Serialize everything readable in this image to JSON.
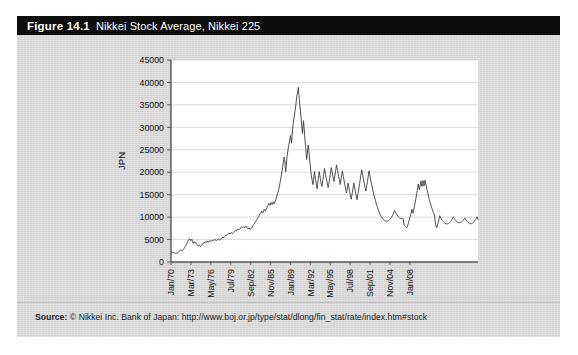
{
  "figure": {
    "number_label": "Figure 14.1",
    "title": "Nikkei Stock Average, Nikkei 225",
    "source_label": "Source:",
    "source_text": "© Nikkei Inc. Bank of Japan: http://www.boj.or.jp/type/stat/dlong/fin_stat/rate/index.htm#stock",
    "colors": {
      "title_bar_background": "#0d0d0d",
      "title_text": "#ffffff",
      "panel_background": "#d9d9d9",
      "plot_background": "#ffffff",
      "series_line": "#3a3a3a",
      "gridline": "#cfcfcf",
      "axis_line": "#555555"
    }
  },
  "chart_data": {
    "type": "line",
    "title": "Nikkei Stock Average, Nikkei 225",
    "xlabel": "",
    "ylabel": "JPN",
    "ylim": [
      0,
      45000
    ],
    "ytick_values": [
      0,
      5000,
      10000,
      15000,
      20000,
      25000,
      30000,
      35000,
      40000,
      45000
    ],
    "ytick_labels": [
      "0",
      "5000",
      "10000",
      "15000",
      "20000",
      "25000",
      "30000",
      "35000",
      "40000",
      "45000"
    ],
    "xtick_labels": [
      "Jan/70",
      "Mar/73",
      "May/76",
      "Jul/79",
      "Sep/82",
      "Nov/85",
      "Jan/89",
      "Mar/92",
      "May/95",
      "Jul/98",
      "Sep/01",
      "Nov/04",
      "Jan/08"
    ],
    "xtick_indices": [
      0,
      38,
      76,
      114,
      152,
      190,
      228,
      266,
      304,
      342,
      380,
      418,
      456
    ],
    "grid": "horizontal",
    "legend": "none",
    "x_start": "Jan/70",
    "x_end": "Jul/10",
    "x_step": "monthly",
    "n_points": 487,
    "series": [
      {
        "name": "Nikkei 225",
        "units": "JPN",
        "values": [
          2380,
          2310,
          2180,
          2120,
          2060,
          2100,
          2010,
          1960,
          1930,
          1990,
          1950,
          1990,
          2000,
          2070,
          2140,
          2290,
          2490,
          2570,
          2680,
          2560,
          2620,
          2700,
          2570,
          2710,
          2820,
          3010,
          3280,
          3480,
          3650,
          3800,
          4030,
          4280,
          4550,
          4860,
          5010,
          5210,
          5100,
          4820,
          4720,
          5130,
          4980,
          4620,
          4350,
          4190,
          4560,
          4400,
          4200,
          4310,
          4150,
          3990,
          3820,
          3720,
          3560,
          3730,
          3830,
          3660,
          3470,
          3460,
          3580,
          3820,
          3930,
          4080,
          4260,
          4410,
          4390,
          4280,
          4490,
          4580,
          4430,
          4520,
          4730,
          4360,
          4480,
          4680,
          4820,
          4740,
          4550,
          4690,
          4810,
          4670,
          4760,
          4880,
          4780,
          4990,
          5010,
          4920,
          4830,
          4710,
          4870,
          5020,
          5160,
          5040,
          4920,
          4860,
          4990,
          5080,
          5120,
          5280,
          5430,
          5560,
          5390,
          5470,
          5620,
          5690,
          5830,
          6020,
          5960,
          6010,
          6090,
          6260,
          6370,
          6450,
          6330,
          6210,
          6440,
          6580,
          6490,
          6300,
          6420,
          6560,
          6620,
          6750,
          6930,
          7120,
          7010,
          6930,
          7180,
          7290,
          7120,
          7260,
          7390,
          7280,
          7410,
          7560,
          7720,
          7850,
          7730,
          7600,
          7790,
          7920,
          7830,
          7670,
          7810,
          7970,
          7890,
          7620,
          7490,
          7350,
          7480,
          7620,
          7390,
          7210,
          7340,
          7520,
          7680,
          7810,
          8010,
          8190,
          8380,
          8520,
          8680,
          8820,
          9040,
          9260,
          9490,
          9720,
          9910,
          10080,
          10300,
          10520,
          10760,
          10910,
          11100,
          11320,
          11030,
          10880,
          11140,
          11460,
          11720,
          11540,
          11320,
          11580,
          11840,
          12100,
          12380,
          12620,
          12890,
          13120,
          12840,
          12620,
          12950,
          13260,
          13020,
          12760,
          13080,
          13420,
          13180,
          12910,
          13240,
          13580,
          13920,
          14280,
          14690,
          15100,
          15480,
          15860,
          16320,
          16980,
          17620,
          18240,
          18920,
          19580,
          20340,
          21080,
          21960,
          22750,
          23390,
          22840,
          21460,
          20120,
          21560,
          22940,
          23860,
          24720,
          25450,
          26120,
          26830,
          27490,
          28180,
          27320,
          26480,
          27940,
          29380,
          30620,
          31480,
          32260,
          32940,
          33820,
          34710,
          35680,
          36940,
          37420,
          38130,
          38920,
          37620,
          36140,
          34820,
          33580,
          32420,
          31180,
          29840,
          28620,
          30260,
          31480,
          29940,
          28380,
          26920,
          25480,
          24120,
          22860,
          23940,
          25120,
          26040,
          24880,
          23620,
          22480,
          21360,
          20180,
          19240,
          18460,
          17820,
          17240,
          18120,
          19340,
          20180,
          19240,
          18360,
          17580,
          16920,
          16340,
          17280,
          18420,
          19260,
          20140,
          19380,
          18620,
          17940,
          17320,
          16840,
          17520,
          18340,
          19120,
          20040,
          20820,
          20180,
          19460,
          18840,
          18260,
          17680,
          17120,
          16580,
          17240,
          17980,
          18720,
          19480,
          20260,
          21040,
          20420,
          19780,
          19140,
          18520,
          17920,
          18640,
          19380,
          20120,
          20880,
          21620,
          20980,
          20340,
          19720,
          19080,
          18460,
          17840,
          17260,
          18020,
          18780,
          19520,
          20280,
          19640,
          19020,
          18380,
          17760,
          17140,
          16540,
          15940,
          15380,
          16120,
          16840,
          17580,
          16940,
          16320,
          15720,
          15120,
          14540,
          13980,
          14680,
          15380,
          16080,
          16820,
          17560,
          16920,
          16280,
          15660,
          15060,
          14460,
          13880,
          14580,
          15280,
          16000,
          16720,
          17460,
          18220,
          18980,
          19760,
          20540,
          19880,
          19240,
          18620,
          18020,
          17440,
          16880,
          16340,
          15820,
          16520,
          17240,
          17980,
          18740,
          19520,
          20320,
          19660,
          19020,
          18400,
          17800,
          17220,
          16660,
          16120,
          15600,
          15100,
          14620,
          14160,
          13720,
          13300,
          12900,
          12520,
          12160,
          11820,
          11500,
          11200,
          10920,
          10660,
          10420,
          10200,
          10000,
          9820,
          9660,
          9520,
          9400,
          9300,
          9220,
          9160,
          9120,
          9100,
          9100,
          9120,
          9160,
          9220,
          9300,
          9400,
          9520,
          9660,
          9820,
          10000,
          10200,
          10420,
          10660,
          10920,
          11200,
          11500,
          11240,
          11000,
          10780,
          10580,
          10400,
          10240,
          10100,
          9980,
          9880,
          9800,
          9740,
          9700,
          9680,
          9680,
          9700,
          9740,
          8860,
          8420,
          8120,
          7960,
          7840,
          7720,
          7620,
          7860,
          8240,
          8620,
          9020,
          9420,
          9840,
          10280,
          10740,
          11220,
          11720,
          11280,
          10860,
          11420,
          12000,
          12600,
          13220,
          13860,
          14520,
          15200,
          15900,
          16620,
          17360,
          16740,
          16140,
          16760,
          17400,
          18060,
          17420,
          16800,
          17460,
          18140,
          17520,
          16920,
          17560,
          18220,
          17620,
          17040,
          16480,
          15940,
          15420,
          14920,
          14440,
          13980,
          13540,
          13120,
          12720,
          12340,
          11980,
          11640,
          11320,
          11020,
          10740,
          10480,
          9220,
          8380,
          7960,
          7620,
          7840,
          8280,
          8760,
          9260,
          9780,
          10320,
          10060,
          9820,
          9600,
          9400,
          9220,
          9060,
          8920,
          8800,
          8700,
          8620,
          8560,
          8520,
          8500,
          8500,
          8520,
          8560,
          8620,
          8700,
          8800,
          8920,
          9060,
          9220,
          9400,
          9600,
          9820,
          10060,
          9840,
          9640,
          9460,
          9300,
          9160,
          9040,
          8940,
          8860,
          8800,
          8760,
          8740,
          8740,
          8760,
          8800,
          8860,
          8940,
          9040,
          9160,
          9300,
          9460,
          9640,
          9840,
          9620,
          9420,
          9240,
          9080,
          8940,
          8820,
          8720,
          8640,
          8580,
          8540,
          8520,
          8520,
          8560,
          8620,
          8700,
          8800,
          8920,
          9060,
          9220,
          9400,
          9600,
          9820,
          10060,
          9820,
          9420
        ]
      }
    ]
  }
}
